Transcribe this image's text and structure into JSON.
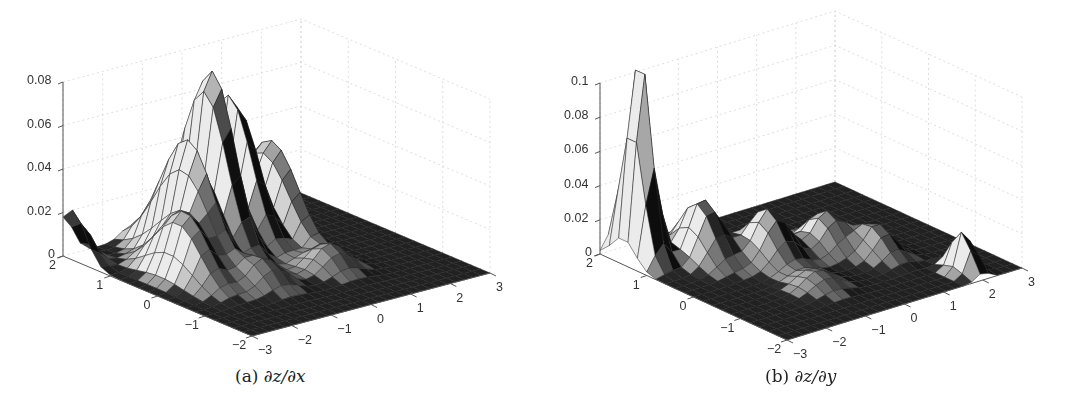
{
  "figure": {
    "panels": [
      {
        "id": "a",
        "caption_prefix": "(a)",
        "caption_math": "∂z/∂x"
      },
      {
        "id": "b",
        "caption_prefix": "(b)",
        "caption_math": "∂z/∂y"
      }
    ]
  },
  "chart_data": [
    {
      "type": "surface3d",
      "title": "(a) ∂z/∂x",
      "xlabel": "",
      "ylabel": "",
      "zlabel": "",
      "x_range": [
        -3,
        3
      ],
      "y_range": [
        -2,
        2
      ],
      "z_range": [
        0,
        0.08
      ],
      "x_ticks": [
        "-3",
        "-2",
        "-1",
        "0",
        "1",
        "2",
        "3"
      ],
      "y_ticks": [
        "-2",
        "-1",
        "0",
        "1",
        "2"
      ],
      "z_ticks": [
        "0",
        "0.02",
        "0.04",
        "0.06",
        "0.08"
      ],
      "grid": true,
      "colormap": "gray",
      "peak_value": 0.085,
      "description": "Multi-ridge surface with peak about 0.085 near center-left; ridges along y; small bump near (x=-3, y=2) about 0.023",
      "features": [
        {
          "x": -0.5,
          "y": 1.0,
          "height": 0.085,
          "sx": 0.35,
          "sy": 0.7
        },
        {
          "x": 0.3,
          "y": 1.2,
          "height": 0.07,
          "sx": 0.3,
          "sy": 0.7
        },
        {
          "x": -1.3,
          "y": 0.8,
          "height": 0.055,
          "sx": 0.35,
          "sy": 0.8
        },
        {
          "x": 1.0,
          "y": 1.0,
          "height": 0.045,
          "sx": 0.3,
          "sy": 0.8
        },
        {
          "x": -2.0,
          "y": 0.3,
          "height": 0.03,
          "sx": 0.4,
          "sy": 0.7
        },
        {
          "x": -3.0,
          "y": 1.8,
          "height": 0.023,
          "sx": 0.35,
          "sy": 0.4
        },
        {
          "x": -1.0,
          "y": -0.6,
          "height": 0.012,
          "sx": 0.5,
          "sy": 0.4
        },
        {
          "x": 0.6,
          "y": -0.6,
          "height": 0.012,
          "sx": 0.5,
          "sy": 0.4
        }
      ]
    },
    {
      "type": "surface3d",
      "title": "(b) ∂z/∂y",
      "xlabel": "",
      "ylabel": "",
      "zlabel": "",
      "x_range": [
        -3,
        3
      ],
      "y_range": [
        -2,
        2
      ],
      "z_range": [
        0,
        0.11
      ],
      "x_ticks": [
        "-3",
        "-2",
        "-1",
        "0",
        "1",
        "2",
        "3"
      ],
      "y_ticks": [
        "-2",
        "-1",
        "0",
        "1",
        "2"
      ],
      "z_ticks": [
        "0",
        "0.02",
        "0.04",
        "0.06",
        "0.08",
        "0.1"
      ],
      "grid": true,
      "colormap": "gray",
      "peak_value": 0.12,
      "description": "Tall narrow spike about 0.12 near (x=-3, y=1.5); several low bumps about 0.02-0.04 in center; small bump about 0.025 near (x=2, y=-1.5)",
      "features": [
        {
          "x": -2.6,
          "y": 1.5,
          "height": 0.12,
          "sx": 0.28,
          "sy": 0.35
        },
        {
          "x": -1.6,
          "y": 1.0,
          "height": 0.035,
          "sx": 0.45,
          "sy": 0.5
        },
        {
          "x": -0.6,
          "y": 0.4,
          "height": 0.03,
          "sx": 0.5,
          "sy": 0.5
        },
        {
          "x": 0.6,
          "y": 0.2,
          "height": 0.022,
          "sx": 0.45,
          "sy": 0.45
        },
        {
          "x": 1.2,
          "y": -0.4,
          "height": 0.018,
          "sx": 0.4,
          "sy": 0.45
        },
        {
          "x": -0.8,
          "y": -0.8,
          "height": 0.01,
          "sx": 0.5,
          "sy": 0.4
        },
        {
          "x": 2.0,
          "y": -1.6,
          "height": 0.026,
          "sx": 0.22,
          "sy": 0.3
        }
      ]
    }
  ],
  "geometry": [
    {
      "origin_z0": [
        63,
        254
      ],
      "z_top_px": 80,
      "corner_front": [
        252,
        336
      ],
      "corner_left": [
        63,
        256
      ],
      "corner_right": [
        490,
        273
      ]
    },
    {
      "origin_z0": [
        60,
        252
      ],
      "z_top_px": 81,
      "corner_front": [
        247,
        340
      ],
      "corner_left": [
        60,
        254
      ],
      "corner_right": [
        482,
        268
      ]
    }
  ]
}
